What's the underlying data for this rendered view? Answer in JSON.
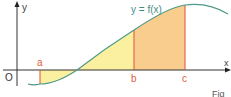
{
  "figure": {
    "axis_y_label": "y",
    "axis_x_label": "x",
    "origin_label": "O",
    "curve_label": "y = f(x)",
    "point_a": "a",
    "point_b": "b",
    "point_c": "c",
    "caption": "Fig"
  },
  "colors": {
    "curve": "#4e9a8a",
    "axis": "#333333",
    "marker_line": "#e0503a",
    "marker_label": "#e0603a",
    "region_yellow": "#fbf0a0",
    "region_orange": "#f8cd8e",
    "text": "#333333",
    "curve_label": "#3f8e84"
  }
}
